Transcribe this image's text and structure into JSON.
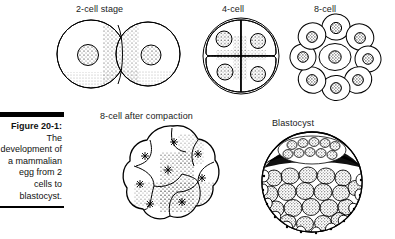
{
  "figure": {
    "caption_title": "Figure 20-1:",
    "caption_body": "The development of a mammalian egg from 2 cells to blastocyst.",
    "background_color": "#ffffff",
    "ink_color": "#000000"
  },
  "stages": [
    {
      "id": "two-cell",
      "label": "2-cell stage",
      "cell_count": 2,
      "description": "Two equal spherical blastomeres side by side, each with a single stippled nucleus, contained within a thin outer membrane."
    },
    {
      "id": "four-cell",
      "label": "4-cell",
      "cell_count": 4,
      "description": "Four wedge-shaped blastomeres packed in a two-by-two arrangement inside a round zona, each with a stippled nucleus."
    },
    {
      "id": "eight-cell",
      "label": "8-cell",
      "cell_count": 8,
      "description": "Eight loosely packed rounded blastomeres forming a rosette around a central cell, each with a dark stippled nucleus."
    },
    {
      "id": "eight-cell-compaction",
      "label": "8-cell after compaction",
      "cell_count": 8,
      "description": "Compacted morula with a lobed outline; cell boundaries flattened against one another, nuclei drawn as small starbursts, surface stippled."
    },
    {
      "id": "blastocyst",
      "label": "Blastocyst",
      "cell_count": null,
      "description": "Spherical blastocyst with an outer trophoblast layer of many small stippled cells and a dark crescent cavity below an inner cell mass at the top."
    }
  ]
}
